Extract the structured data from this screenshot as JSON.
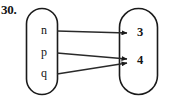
{
  "figure": {
    "problem_number": "30.",
    "background_color": "#ffffff",
    "stroke_color": "#1a1a1a",
    "line_color": "#2a2a2a"
  },
  "domain_set": {
    "name": "domain-oval",
    "elements": [
      {
        "label": "n",
        "x": 44,
        "y": 31
      },
      {
        "label": "p",
        "x": 44,
        "y": 53
      },
      {
        "label": "q",
        "x": 44,
        "y": 74
      }
    ]
  },
  "range_set": {
    "name": "range-oval",
    "elements": [
      {
        "label": "3",
        "x": 140,
        "y": 33
      },
      {
        "label": "4",
        "x": 140,
        "y": 61
      }
    ]
  },
  "mappings": [
    {
      "from": "n",
      "to": "3",
      "x1": 57,
      "y1": 31,
      "x2": 127,
      "y2": 33
    },
    {
      "from": "p",
      "to": "4",
      "x1": 57,
      "y1": 53,
      "x2": 127,
      "y2": 59
    },
    {
      "from": "q",
      "to": "4",
      "x1": 57,
      "y1": 74,
      "x2": 127,
      "y2": 63
    }
  ]
}
